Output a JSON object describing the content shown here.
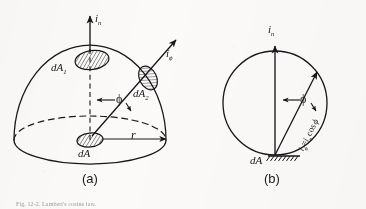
{
  "figure": {
    "kind": "textbook-line-drawing",
    "ink_color": "#17161a",
    "paper_color": "#fbfaf8",
    "caption_partial": "Fig. 12-2. Lambert's cosine law.",
    "panels": [
      {
        "id": "a",
        "panel_label": "(a)",
        "description": "hemisphere with normal and differential areas",
        "labels": {
          "normal_intensity": "i",
          "normal_intensity_sub": "n",
          "area_top": "dA",
          "area_top_sub": "1",
          "area_side": "dA",
          "area_side_sub": "2",
          "oblique_intensity": "i",
          "oblique_intensity_sub": "ϕ",
          "angle": "ϕ",
          "radius": "r",
          "base_area": "dA"
        }
      },
      {
        "id": "b",
        "panel_label": "(b)",
        "description": "circular cross-section showing cosine projection",
        "labels": {
          "normal_intensity": "i",
          "normal_intensity_sub": "n",
          "angle": "ϕ",
          "base_area": "dA",
          "formula": "iϕ = in cos ϕ",
          "formula_parts": {
            "lhs_sym": "i",
            "lhs_sub": "ϕ",
            "eq": "=",
            "rhs_sym": "i",
            "rhs_sub": "n",
            "rhs_fn": "cos",
            "rhs_arg": "ϕ"
          }
        }
      }
    ]
  }
}
